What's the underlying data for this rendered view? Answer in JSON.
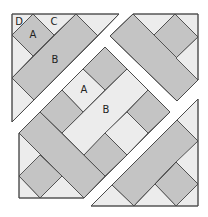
{
  "figure": {
    "colors": {
      "dark": "#c4c4c4",
      "light": "#ececec",
      "sashing": "#ffffff",
      "outline": "#4a4a4a"
    }
  },
  "labels": {
    "tl_d": "D",
    "tl_c": "C",
    "tl_a": "A",
    "tl_b": "B",
    "center_a": "A",
    "center_b": "B"
  },
  "sections": [
    {
      "name": "top-left-triangle",
      "pieces": [
        "D corner triangle",
        "A square",
        "C triangle",
        "B rectangle",
        "corner triangles"
      ]
    },
    {
      "name": "top-right-triangle",
      "pieces": [
        "B rectangle",
        "A square",
        "corner triangles"
      ]
    },
    {
      "name": "center-panel",
      "pieces": [
        "A square (light)",
        "B rectangle (light)",
        "A squares (dark)",
        "B rectangles (dark)"
      ]
    },
    {
      "name": "bottom-right-triangle",
      "pieces": [
        "B rectangle",
        "A square",
        "corner triangles"
      ]
    }
  ]
}
